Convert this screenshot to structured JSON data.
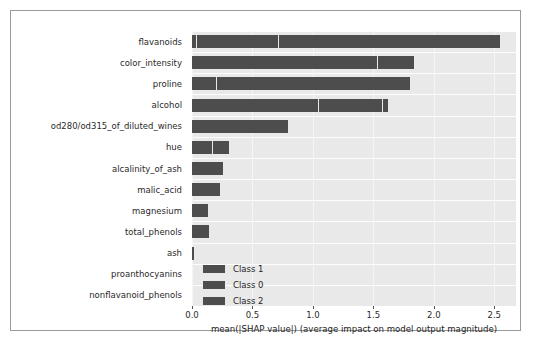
{
  "chart_data": {
    "type": "bar",
    "orientation": "horizontal",
    "stacked": true,
    "title": "",
    "xlabel": "mean(|SHAP value|) (average impact on model output magnitude)",
    "ylabel": "",
    "xlim": [
      0.0,
      2.68
    ],
    "xticks": [
      0.0,
      0.5,
      1.0,
      1.5,
      2.0,
      2.5
    ],
    "xticklabels": [
      "0.0",
      "0.5",
      "1.0",
      "1.5",
      "2.0",
      "2.5"
    ],
    "grid": true,
    "grid_axis": "both",
    "legend_position": "lower-left-inside",
    "categories": [
      "flavanoids",
      "color_intensity",
      "proline",
      "alcohol",
      "od280/od315_of_diluted_wines",
      "hue",
      "alcalinity_of_ash",
      "malic_acid",
      "magnesium",
      "total_phenols",
      "ash",
      "proanthocyanins",
      "nonflavanoid_phenols"
    ],
    "series": [
      {
        "name": "Class 1",
        "color": "#4d4d4d",
        "values": [
          0.04,
          1.54,
          0.21,
          1.05,
          0.79,
          0.17,
          0.26,
          0.23,
          0.13,
          0.14,
          0.016,
          0.0,
          0.0
        ]
      },
      {
        "name": "Class 0",
        "color": "#4d4d4d",
        "values": [
          0.68,
          0.3,
          1.59,
          0.53,
          0.0,
          0.14,
          0.0,
          0.0,
          0.0,
          0.0,
          0.0,
          0.0,
          0.0
        ]
      },
      {
        "name": "Class 2",
        "color": "#4d4d4d",
        "values": [
          1.83,
          0.0,
          0.0,
          0.04,
          0.0,
          0.0,
          0.0,
          0.0,
          0.0,
          0.0,
          0.0,
          0.0,
          0.0
        ]
      }
    ],
    "totals": [
      2.55,
      1.84,
      1.8,
      1.62,
      0.79,
      0.31,
      0.26,
      0.23,
      0.13,
      0.14,
      0.016,
      0.0,
      0.0
    ],
    "colors": {
      "plot_background": "#e9e9e9",
      "gridline": "#fdfdfd",
      "bar": "#4d4d4d",
      "text": "#1e1e1e",
      "frame": "#9a9a9a"
    }
  },
  "legend": {
    "entries": [
      {
        "label": "Class 1",
        "color": "#4d4d4d"
      },
      {
        "label": "Class 0",
        "color": "#4d4d4d"
      },
      {
        "label": "Class 2",
        "color": "#4d4d4d"
      }
    ]
  }
}
